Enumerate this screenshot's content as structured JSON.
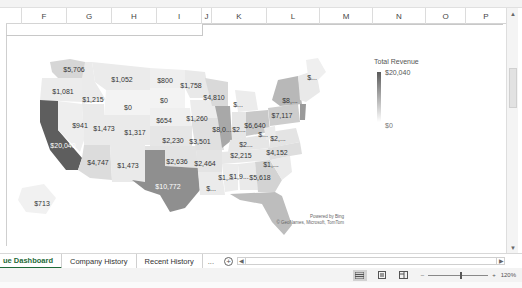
{
  "spreadsheet": {
    "columns": [
      "",
      "F",
      "G",
      "H",
      "I",
      "J",
      "K",
      "L",
      "M",
      "N",
      "O",
      "P"
    ]
  },
  "map": {
    "legend": {
      "title": "Total Revenue",
      "max": "$20,040",
      "min": "$0"
    },
    "attribution": {
      "line1": "Powered by Bing",
      "line2": "© GeoNames, Microsoft, TomTom"
    },
    "colors": {
      "max": "#5a5a5a",
      "min": "#f2f2f2"
    },
    "states": [
      {
        "code": "WA",
        "label": "$5,706"
      },
      {
        "code": "OR",
        "label": "$1,081"
      },
      {
        "code": "CA",
        "label": "$20,040"
      },
      {
        "code": "ID",
        "label": "$1,215"
      },
      {
        "code": "NV",
        "label": "$941"
      },
      {
        "code": "MT",
        "label": "$1,052"
      },
      {
        "code": "WY",
        "label": "$0"
      },
      {
        "code": "UT",
        "label": "$1,473"
      },
      {
        "code": "AZ",
        "label": "$4,747"
      },
      {
        "code": "CO",
        "label": "$1,317"
      },
      {
        "code": "NM",
        "label": "$1,473"
      },
      {
        "code": "ND",
        "label": "$800"
      },
      {
        "code": "SD",
        "label": "$0"
      },
      {
        "code": "NE",
        "label": "$654"
      },
      {
        "code": "KS",
        "label": "$2,230"
      },
      {
        "code": "OK",
        "label": "$2,636"
      },
      {
        "code": "TX",
        "label": "$10,772"
      },
      {
        "code": "MN",
        "label": "$1,758"
      },
      {
        "code": "IA",
        "label": "$1,260"
      },
      {
        "code": "MO",
        "label": "$3,501"
      },
      {
        "code": "AR",
        "label": "$2,464"
      },
      {
        "code": "LA",
        "label": "$..."
      },
      {
        "code": "WI",
        "label": "$4,810"
      },
      {
        "code": "IL",
        "label": "$8,0..."
      },
      {
        "code": "MI",
        "label": "$..."
      },
      {
        "code": "IN",
        "label": "$2..."
      },
      {
        "code": "OH",
        "label": "$6,640"
      },
      {
        "code": "KY",
        "label": "$2..."
      },
      {
        "code": "TN",
        "label": "$2,215"
      },
      {
        "code": "MS",
        "label": "$1,..."
      },
      {
        "code": "AL",
        "label": "$1,9..."
      },
      {
        "code": "GA",
        "label": "$5,618"
      },
      {
        "code": "FL",
        "label": ""
      },
      {
        "code": "SC",
        "label": "$1,..."
      },
      {
        "code": "NC",
        "label": "$4,152"
      },
      {
        "code": "VA",
        "label": "$2,..."
      },
      {
        "code": "WV",
        "label": "$..."
      },
      {
        "code": "PA",
        "label": "$7,117"
      },
      {
        "code": "NY",
        "label": "$8,..."
      },
      {
        "code": "ME",
        "label": "$..."
      },
      {
        "code": "AK",
        "label": "$713"
      }
    ]
  },
  "sheet_tabs": [
    {
      "label": "ue Dashboard",
      "active": true
    },
    {
      "label": "Company History",
      "active": false
    },
    {
      "label": "Recent History",
      "active": false
    }
  ],
  "tab_controls": {
    "more": "...",
    "add": "+"
  },
  "status": {
    "zoom_minus": "–",
    "zoom_plus": "+",
    "zoom_level": "120%"
  }
}
